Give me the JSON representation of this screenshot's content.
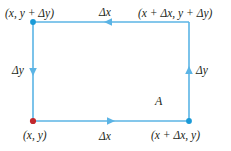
{
  "figure": {
    "type": "geometry-diagram",
    "colors": {
      "edge": "#5bb4e5",
      "vertex_blue": "#1a9ad7",
      "vertex_red": "#c1272d",
      "text": "#231f20",
      "background": "#ffffff"
    },
    "corner_labels": {
      "top_left": "(x, y + Δy)",
      "top_right": "(x + Δx, y + Δy)",
      "bottom_left": "(x, y)",
      "bottom_right": "(x + Δx, y)"
    },
    "edge_labels": {
      "top": "Δx",
      "bottom": "Δx",
      "left": "Δy",
      "right": "Δy"
    },
    "region_label": "A",
    "arrows": {
      "top": "left",
      "bottom": "right",
      "left": "down",
      "right": "up"
    },
    "vertices": [
      {
        "name": "bottom-left",
        "x": 33,
        "y": 121,
        "marker": "red-dot"
      },
      {
        "name": "top-left",
        "x": 33,
        "y": 22,
        "marker": "blue-dot"
      },
      {
        "name": "top-right",
        "x": 189,
        "y": 22,
        "marker": "none"
      },
      {
        "name": "bottom-right",
        "x": 189,
        "y": 121,
        "marker": "blue-dot"
      }
    ]
  }
}
